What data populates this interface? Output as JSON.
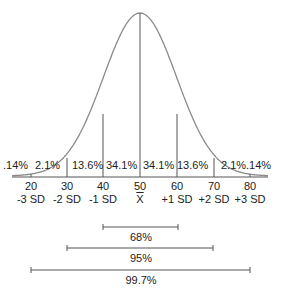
{
  "chart_data": {
    "type": "line",
    "xlabel": "",
    "ylabel": "",
    "mean": 50,
    "sd": 10,
    "x_ticks": [
      20,
      30,
      40,
      50,
      60,
      70,
      80
    ],
    "sd_labels": [
      "-3 SD",
      "-2 SD",
      "-1 SD",
      "X̄",
      "+1 SD",
      "+2 SD",
      "+3 SD"
    ],
    "region_percentages": [
      ".14%",
      "2.1%",
      "13.6%",
      "34.1%",
      "34.1%",
      "13.6%",
      "2.1%",
      ".14%"
    ],
    "intervals": [
      {
        "label": "68%",
        "from": 40,
        "to": 60
      },
      {
        "label": "95%",
        "from": 30,
        "to": 70
      },
      {
        "label": "99.7%",
        "from": 20,
        "to": 80
      }
    ],
    "grid": false,
    "colors": {
      "curve": "#8a8a8a",
      "lines": "#555555",
      "text": "#222222"
    }
  },
  "labels": {
    "pct": [
      ".14%",
      "2.1%",
      "13.6%",
      "34.1%",
      "34.1%",
      "13.6%",
      "2.1%",
      ".14%"
    ],
    "ticks": [
      "20",
      "30",
      "40",
      "50",
      "60",
      "70",
      "80"
    ],
    "sd": [
      "-3 SD",
      "-2 SD",
      "-1 SD",
      "X",
      "+1 SD",
      "+2 SD",
      "+3 SD"
    ],
    "bars": [
      "68%",
      "95%",
      "99.7%"
    ]
  }
}
